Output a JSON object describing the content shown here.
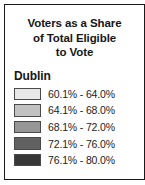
{
  "legend": {
    "title_lines": [
      "Voters as a Share",
      "of Total Eligible",
      "to Vote"
    ],
    "subheading": "Dublin",
    "classes": [
      {
        "label": "60.1% - 64.0%",
        "color": "#e8e8e8"
      },
      {
        "label": "64.1% - 68.0%",
        "color": "#c2c2c2"
      },
      {
        "label": "68.1% - 72.0%",
        "color": "#969696"
      },
      {
        "label": "72.1% - 76.0%",
        "color": "#616161"
      },
      {
        "label": "76.1% - 80.0%",
        "color": "#383838"
      }
    ]
  },
  "chart_data": {
    "type": "table",
    "title": "Voters as a Share of Total Eligible to Vote",
    "subtitle": "Dublin",
    "categories": [
      "60.1% - 64.0%",
      "64.1% - 68.0%",
      "68.1% - 72.0%",
      "72.1% - 76.0%",
      "76.1% - 80.0%"
    ],
    "colors": [
      "#e8e8e8",
      "#c2c2c2",
      "#969696",
      "#616161",
      "#383838"
    ],
    "class_bounds": [
      [
        60.1,
        64.0
      ],
      [
        64.1,
        68.0
      ],
      [
        68.1,
        72.0
      ],
      [
        72.1,
        76.0
      ],
      [
        76.1,
        80.0
      ]
    ],
    "unit": "%",
    "legend_position": "standalone",
    "grid": false
  }
}
